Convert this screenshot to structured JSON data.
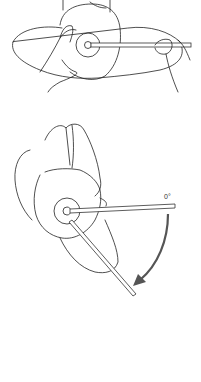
{
  "figure": {
    "panels": [
      {
        "id": "top",
        "description": "Examiner hands aligning goniometer on top of patient's head, neutral position"
      },
      {
        "id": "bottom",
        "description": "Head rotated; goniometer moving arm follows rotation from 0° reference"
      }
    ],
    "angle_label": "0°",
    "colors": {
      "line": "#222222",
      "arrow": "#555555",
      "background": "#ffffff"
    }
  }
}
